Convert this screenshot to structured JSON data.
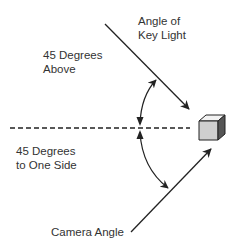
{
  "diagram": {
    "labels": {
      "key_light": "Angle of\nKey Light",
      "above": "45 Degrees\nAbove",
      "side": "45 Degrees\nto One Side",
      "camera": "Camera Angle"
    },
    "colors": {
      "line": "#222222",
      "cube_top": "#f2f2f2",
      "cube_front": "#cfcfcf",
      "cube_side": "#555555"
    }
  }
}
